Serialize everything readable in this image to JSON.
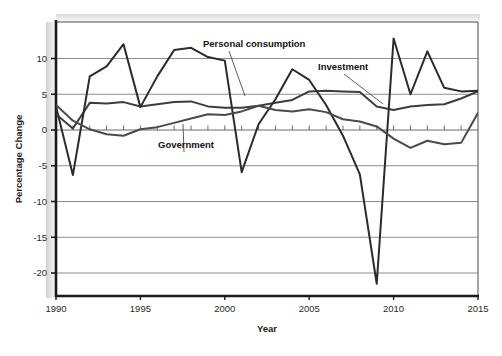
{
  "chart_data": {
    "type": "line",
    "title": "",
    "xlabel": "Year",
    "ylabel": "Percentage Change",
    "xlim": [
      1990,
      2015
    ],
    "ylim": [
      -23.5,
      14.0
    ],
    "xticks": [
      1990,
      1995,
      2000,
      2005,
      2010,
      2015
    ],
    "yticks": [
      10,
      5,
      0,
      -5,
      -10,
      -15,
      -20
    ],
    "ytick_labels": [
      "10",
      "5",
      "0",
      "-5",
      "-10",
      "-15",
      "-20"
    ],
    "xtick_labels": [
      "1990",
      "1995",
      "2000",
      "2005",
      "2010",
      "2015"
    ],
    "minor_xticks_every": 1,
    "grid": "horizontal",
    "legend_position": "inline-annotations",
    "x": [
      1990,
      1991,
      1992,
      1993,
      1994,
      1995,
      1996,
      1997,
      1998,
      1999,
      2000,
      2001,
      2002,
      2003,
      2004,
      2005,
      2006,
      2007,
      2008,
      2009,
      2010,
      2011,
      2012,
      2013,
      2014,
      2015
    ],
    "series": [
      {
        "name": "Personal consumption",
        "color": "#3d3d3d",
        "values": [
          2.2,
          0.2,
          3.8,
          3.7,
          3.9,
          3.3,
          3.6,
          3.9,
          4.0,
          3.3,
          3.1,
          3.1,
          3.4,
          3.8,
          4.2,
          5.4,
          5.5,
          5.4,
          5.3,
          3.3,
          2.8,
          3.3,
          3.5,
          3.6,
          4.4,
          5.4
        ]
      },
      {
        "name": "Investment",
        "color": "#2b2b2b",
        "values": [
          3.3,
          -6.3,
          7.5,
          8.9,
          12.0,
          3.2,
          7.5,
          11.2,
          11.5,
          10.2,
          9.7,
          -5.9,
          0.8,
          4.3,
          8.5,
          7.0,
          3.5,
          -0.8,
          -6.2,
          -21.5,
          12.8,
          5.0,
          11.0,
          5.9,
          5.4,
          5.5
        ]
      },
      {
        "name": "Government",
        "color": "#4a4a4a",
        "values": [
          3.5,
          1.3,
          0.1,
          -0.6,
          -0.8,
          0.1,
          0.4,
          1.0,
          1.6,
          2.2,
          2.1,
          2.6,
          3.4,
          2.8,
          2.6,
          2.9,
          2.5,
          1.5,
          1.2,
          0.5,
          -1.2,
          -2.5,
          -1.5,
          -2.0,
          -1.8,
          2.4
        ]
      }
    ],
    "annotations": [
      {
        "text": "Personal consumption",
        "x": 203,
        "y": 47,
        "leader_to_x": 245,
        "leader_to_y": 96
      },
      {
        "text": "Investment",
        "x": 318,
        "y": 70,
        "leader_to_x": 383,
        "leader_to_y": 104
      },
      {
        "text": "Government",
        "x": 158,
        "y": 148,
        "leader_to_x": 183,
        "leader_to_y": 124
      }
    ]
  }
}
